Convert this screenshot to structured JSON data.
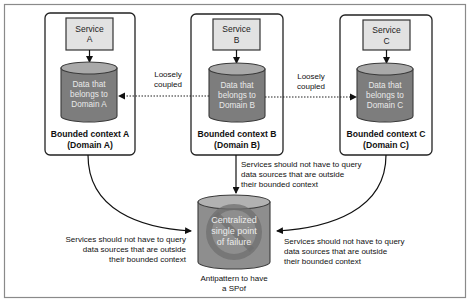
{
  "diagram": {
    "contexts": [
      {
        "id": "A",
        "service_line1": "Service",
        "service_line2": "A",
        "data_line1": "Data that",
        "data_line2": "belongs to",
        "data_line3": "Domain A",
        "label_line1": "Bounded context A",
        "label_line2": "(Domain A)"
      },
      {
        "id": "B",
        "service_line1": "Service",
        "service_line2": "B",
        "data_line1": "Data that",
        "data_line2": "belongs to",
        "data_line3": "Domain B",
        "label_line1": "Bounded context B",
        "label_line2": "(Domain B)"
      },
      {
        "id": "C",
        "service_line1": "Service",
        "service_line2": "C",
        "data_line1": "Data that",
        "data_line2": "belongs to",
        "data_line3": "Domain C",
        "label_line1": "Bounded context C",
        "label_line2": "(Domain C)"
      }
    ],
    "couplings": [
      {
        "from": "B",
        "to": "A",
        "line1": "Loosely",
        "line2": "coupled"
      },
      {
        "from": "B",
        "to": "C",
        "line1": "Loosely",
        "line2": "coupled"
      }
    ],
    "notes": {
      "left": [
        "Services should not have to query",
        "data sources that are outside",
        "their bounded context"
      ],
      "center": [
        "Services should not have to query",
        "data sources that are outside",
        "their bounded context"
      ],
      "right": [
        "Services should not have to query",
        "data sources that are outside",
        "their bounded context"
      ]
    },
    "spof": {
      "line1": "Centralized",
      "line2": "single point",
      "line3": "of failure",
      "caption_line1": "Antipattern to have",
      "caption_line2": "a SPof",
      "icon": "prohibited-sign-icon"
    },
    "colors": {
      "service_fill": "#e2e2e2",
      "cylinder_fill": "#7d7d7d",
      "cylinder_top": "#a9a9a9",
      "frame_stroke": "#8a8a8a"
    }
  }
}
